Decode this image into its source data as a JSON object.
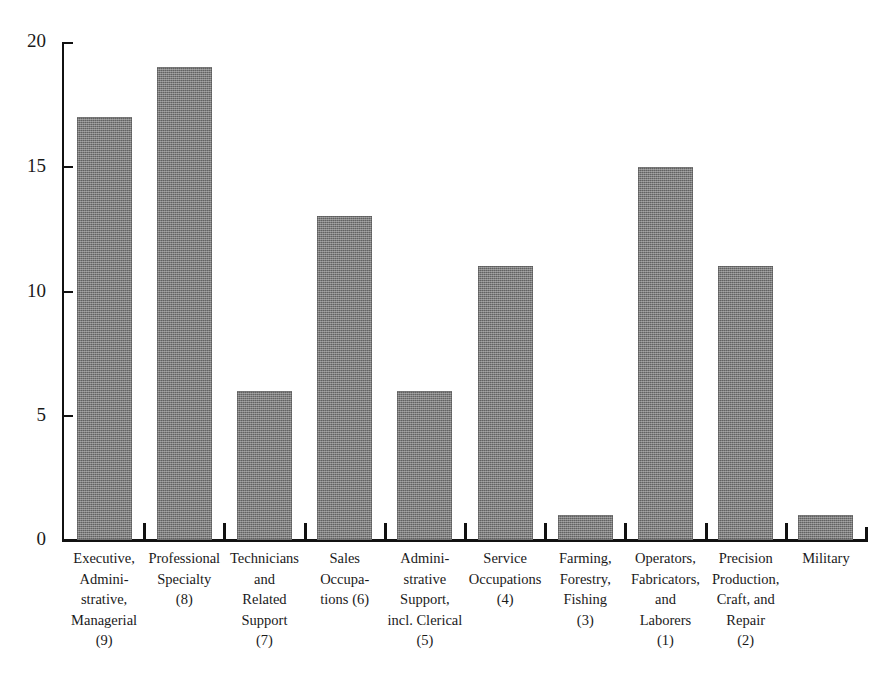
{
  "chart_data": {
    "type": "bar",
    "title": "",
    "subtitle": "",
    "xlabel": "",
    "ylabel": "",
    "ylim": [
      0,
      20
    ],
    "yticks": [
      0,
      5,
      10,
      15,
      20
    ],
    "ytick_labels": [
      "0",
      "5",
      "10",
      "15",
      "20"
    ],
    "grid": false,
    "legend": null,
    "bar_color": "#7d7d7d",
    "axis_color": "#111111",
    "categories": [
      "Executive, Admini-\nstrative,\nManagerial\n(9)",
      "Professional\nSpecialty\n(8)",
      "Technicians\nand\nRelated\nSupport\n(7)",
      "Sales\nOccupa-\ntions (6)",
      "Admini-\nstrative\nSupport,\nincl. Clerical\n(5)",
      "Service\nOccupations\n(4)",
      "Farming,\nForestry,\nFishing\n(3)",
      "Operators,\nFabricators,\nand\nLaborers\n(1)",
      "Precision\nProduction,\nCraft, and\nRepair\n(2)",
      "Military"
    ],
    "values": [
      17,
      19,
      6,
      13,
      6,
      11,
      1,
      15,
      11,
      1
    ],
    "bars": [
      {
        "label": "Executive, Administrative, Managerial",
        "rank": 9,
        "value": 17
      },
      {
        "label": "Professional Specialty",
        "rank": 8,
        "value": 19
      },
      {
        "label": "Technicians and Related Support",
        "rank": 7,
        "value": 6
      },
      {
        "label": "Sales Occupations",
        "rank": 6,
        "value": 13
      },
      {
        "label": "Administrative Support, incl. Clerical",
        "rank": 5,
        "value": 6
      },
      {
        "label": "Service Occupations",
        "rank": 4,
        "value": 11
      },
      {
        "label": "Farming, Forestry, Fishing",
        "rank": 3,
        "value": 1
      },
      {
        "label": "Operators, Fabricators, and Laborers",
        "rank": 1,
        "value": 15
      },
      {
        "label": "Precision Production, Craft, and Repair",
        "rank": 2,
        "value": 11
      },
      {
        "label": "Military",
        "rank": null,
        "value": 1
      }
    ]
  },
  "axis": {
    "y_tick_labels": [
      "20",
      "15",
      "10",
      "5",
      "0"
    ]
  },
  "x_labels": [
    "Executive,\nAdmini-\nstrative,\nManagerial\n(9)",
    "Professional\nSpecialty\n(8)",
    "Technicians\nand\nRelated\nSupport\n(7)",
    "Sales\nOccupa-\ntions (6)",
    "Admini-\nstrative\nSupport,\nincl. Clerical\n(5)",
    "Service\nOccupations\n(4)",
    "Farming,\nForestry,\nFishing\n(3)",
    "Operators,\nFabricators,\nand\nLaborers\n(1)",
    "Precision\nProduction,\nCraft, and\nRepair\n(2)",
    "Military"
  ]
}
